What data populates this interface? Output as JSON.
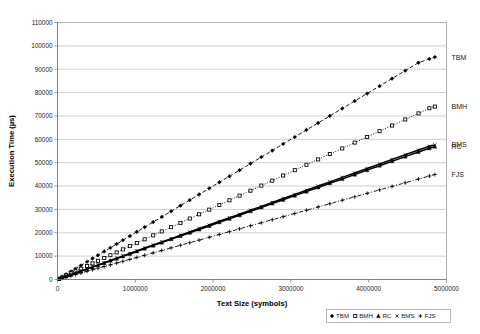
{
  "chart_data": {
    "type": "scatter",
    "title": "",
    "xlabel": "Text Size (symbols)",
    "ylabel": "Execution Time (µs)",
    "xlim": [
      0,
      5000000
    ],
    "ylim": [
      0,
      110000
    ],
    "grid": "horizontal",
    "legend_position": "bottom-right",
    "xticks": [
      0,
      1000000,
      2000000,
      3000000,
      4000000,
      5000000
    ],
    "xtick_labels": [
      "0",
      "1000000",
      "2000000",
      "3000000",
      "4000000",
      "5000000"
    ],
    "yticks": [
      0,
      10000,
      20000,
      30000,
      40000,
      50000,
      60000,
      70000,
      80000,
      90000,
      100000,
      110000
    ],
    "ytick_labels": [
      "0",
      "10000",
      "20000",
      "30000",
      "40000",
      "50000",
      "60000",
      "70000",
      "80000",
      "90000",
      "100000",
      "110000"
    ],
    "series": [
      {
        "name": "TBM",
        "marker": "diamond",
        "linestyle": "dashed",
        "end_label": "TBM",
        "x": [
          20000,
          60000,
          110000,
          170000,
          230000,
          300000,
          380000,
          450000,
          520000,
          600000,
          680000,
          760000,
          840000,
          930000,
          1020000,
          1120000,
          1230000,
          1340000,
          1460000,
          1580000,
          1700000,
          1820000,
          1950000,
          2080000,
          2210000,
          2340000,
          2480000,
          2620000,
          2760000,
          2900000,
          3050000,
          3200000,
          3350000,
          3500000,
          3660000,
          3820000,
          3980000,
          4140000,
          4300000,
          4470000,
          4640000,
          4780000,
          4850000
        ],
        "y": [
          400,
          1200,
          2200,
          3400,
          4600,
          6000,
          7600,
          9000,
          10400,
          12000,
          13600,
          15200,
          16800,
          18600,
          20400,
          22400,
          24600,
          26800,
          29200,
          31600,
          34000,
          36400,
          39000,
          41600,
          44200,
          46800,
          49600,
          52400,
          55200,
          58000,
          61000,
          64000,
          67000,
          70000,
          73200,
          76400,
          79600,
          82800,
          86000,
          89400,
          92800,
          94400,
          95200
        ]
      },
      {
        "name": "BMH",
        "marker": "square",
        "linestyle": "dotted",
        "end_label": "BMH",
        "x": [
          20000,
          60000,
          110000,
          170000,
          230000,
          300000,
          380000,
          450000,
          520000,
          600000,
          680000,
          760000,
          840000,
          930000,
          1020000,
          1120000,
          1230000,
          1340000,
          1460000,
          1580000,
          1700000,
          1820000,
          1950000,
          2080000,
          2210000,
          2340000,
          2480000,
          2620000,
          2760000,
          2900000,
          3050000,
          3200000,
          3350000,
          3500000,
          3660000,
          3820000,
          3980000,
          4140000,
          4300000,
          4470000,
          4640000,
          4780000,
          4850000
        ],
        "y": [
          300,
          900,
          1700,
          2600,
          3500,
          4600,
          5800,
          6900,
          8000,
          9200,
          10400,
          11600,
          12900,
          14300,
          15600,
          17200,
          18900,
          20600,
          22400,
          24200,
          26100,
          27900,
          29900,
          31900,
          33900,
          35900,
          38000,
          40200,
          42300,
          44500,
          46800,
          49100,
          51400,
          53700,
          56100,
          58600,
          61000,
          63500,
          65900,
          68500,
          71100,
          73300,
          74000
        ]
      },
      {
        "name": "RC",
        "marker": "triangle",
        "linestyle": "solid",
        "end_label": "RC",
        "x": [
          20000,
          60000,
          110000,
          170000,
          230000,
          300000,
          380000,
          450000,
          520000,
          600000,
          680000,
          760000,
          840000,
          930000,
          1020000,
          1120000,
          1230000,
          1340000,
          1460000,
          1580000,
          1700000,
          1820000,
          1950000,
          2080000,
          2210000,
          2340000,
          2480000,
          2620000,
          2760000,
          2900000,
          3050000,
          3200000,
          3350000,
          3500000,
          3660000,
          3820000,
          3980000,
          4140000,
          4300000,
          4470000,
          4640000,
          4780000,
          4850000
        ],
        "y": [
          230,
          700,
          1300,
          2000,
          2700,
          3500,
          4500,
          5300,
          6100,
          7000,
          8000,
          8900,
          9900,
          10900,
          12000,
          13200,
          14500,
          15800,
          17200,
          18600,
          20000,
          21400,
          22900,
          24500,
          26000,
          27500,
          29200,
          30800,
          32500,
          34100,
          35900,
          37600,
          39400,
          41200,
          43000,
          44900,
          46800,
          48700,
          50600,
          52600,
          54600,
          56200,
          56800
        ]
      },
      {
        "name": "BMS",
        "marker": "cross",
        "linestyle": "solid",
        "end_label": "BMS",
        "x": [
          20000,
          60000,
          110000,
          170000,
          230000,
          300000,
          380000,
          450000,
          520000,
          600000,
          680000,
          760000,
          840000,
          930000,
          1020000,
          1120000,
          1230000,
          1340000,
          1460000,
          1580000,
          1700000,
          1820000,
          1950000,
          2080000,
          2210000,
          2340000,
          2480000,
          2620000,
          2760000,
          2900000,
          3050000,
          3200000,
          3350000,
          3500000,
          3660000,
          3820000,
          3980000,
          4140000,
          4300000,
          4470000,
          4640000,
          4780000,
          4850000
        ],
        "y": [
          240,
          720,
          1340,
          2050,
          2780,
          3600,
          4600,
          5420,
          6250,
          7180,
          8180,
          9100,
          10100,
          11150,
          12260,
          13450,
          14800,
          16100,
          17500,
          18950,
          20350,
          21800,
          23300,
          24900,
          26450,
          27980,
          29700,
          31300,
          33000,
          34650,
          36450,
          38200,
          40000,
          41800,
          43700,
          45600,
          47500,
          49400,
          51400,
          53400,
          55400,
          57000,
          57600
        ]
      },
      {
        "name": "FJS",
        "marker": "plus",
        "linestyle": "dash-dot",
        "end_label": "FJS",
        "x": [
          20000,
          60000,
          110000,
          170000,
          230000,
          300000,
          380000,
          450000,
          520000,
          600000,
          680000,
          760000,
          840000,
          930000,
          1020000,
          1120000,
          1230000,
          1340000,
          1460000,
          1580000,
          1700000,
          1820000,
          1950000,
          2080000,
          2210000,
          2340000,
          2480000,
          2620000,
          2760000,
          2900000,
          3050000,
          3200000,
          3350000,
          3500000,
          3660000,
          3820000,
          3980000,
          4140000,
          4300000,
          4470000,
          4640000,
          4780000,
          4850000
        ],
        "y": [
          180,
          560,
          1020,
          1580,
          2140,
          2780,
          3520,
          4170,
          4820,
          5560,
          6300,
          7040,
          7780,
          8620,
          9450,
          10380,
          11400,
          12420,
          13530,
          14640,
          15750,
          16860,
          18070,
          19280,
          20480,
          21690,
          22990,
          24280,
          25580,
          26870,
          28260,
          29650,
          31040,
          32430,
          33910,
          35400,
          36880,
          38360,
          39840,
          41420,
          42990,
          44290,
          44940
        ]
      }
    ],
    "legend": [
      {
        "label": "TBM",
        "marker": "diamond"
      },
      {
        "label": "BMH",
        "marker": "square"
      },
      {
        "label": "RC",
        "marker": "triangle"
      },
      {
        "label": "BMS",
        "marker": "cross"
      },
      {
        "label": "FJS",
        "marker": "plus"
      }
    ]
  }
}
